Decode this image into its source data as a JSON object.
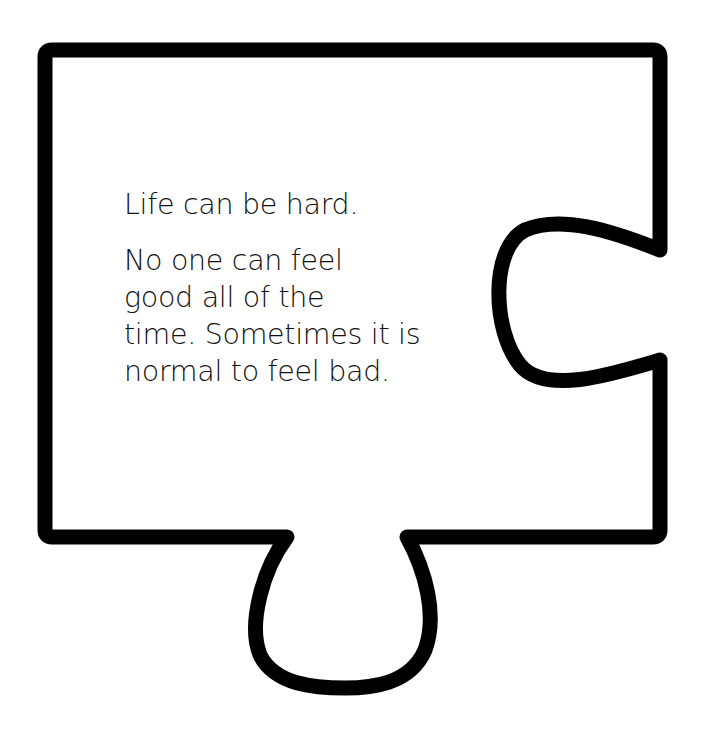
{
  "card": {
    "shape": "puzzle-piece",
    "stroke_color": "#000000",
    "fill_color": "#ffffff",
    "stroke_width": 15
  },
  "text": {
    "paragraph1": "Life can be hard.",
    "paragraph2_lines": [
      "No one can feel",
      "good all of the",
      "time. Sometimes it is",
      "normal to feel bad."
    ]
  }
}
